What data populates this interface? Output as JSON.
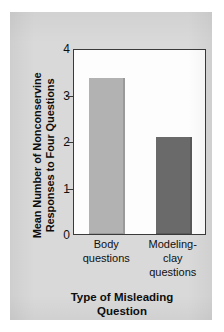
{
  "chart_data": {
    "type": "bar",
    "title": "",
    "categories": [
      "Body\nquestions",
      "Modeling-clay\nquestions"
    ],
    "values": [
      3.35,
      2.08
    ],
    "xlabel": "Type of Misleading\nQuestion",
    "ylabel": "Mean Number of Nonconservine\nResponses to Four Questions",
    "ylim": [
      0,
      4
    ],
    "yticks": [
      "0",
      "1",
      "2",
      "3",
      "4"
    ],
    "ytick_values": [
      0,
      1,
      2,
      3,
      4
    ],
    "grid": false,
    "legend": false,
    "bar_colors": [
      "#b2b2b2",
      "#6a6a6a"
    ],
    "bar_edge_colors": [
      "#9a9a9a",
      "#585858"
    ],
    "plot_background": "#fdfdfd",
    "panel_background": "#d9d9d9",
    "axis_color": "#3a3a3a",
    "text_color": "#101010"
  }
}
